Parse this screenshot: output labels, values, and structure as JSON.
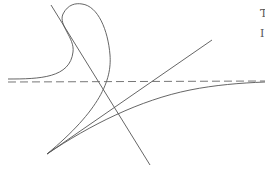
{
  "figure": {
    "stroke_color": "#555555",
    "dash_color": "#666666",
    "edge_glyphs": [
      "T",
      "I"
    ]
  }
}
